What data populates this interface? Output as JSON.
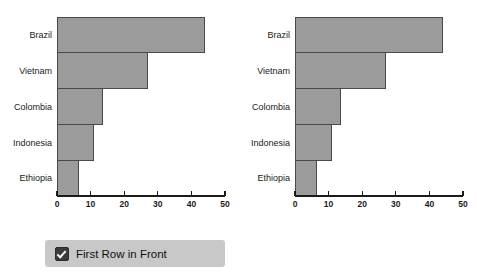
{
  "chart_data": [
    {
      "type": "bar",
      "orientation": "horizontal",
      "title": "",
      "xlabel": "",
      "ylabel": "",
      "categories": [
        "Brazil",
        "Vietnam",
        "Colombia",
        "Indonesia",
        "Ethiopia"
      ],
      "values": [
        44,
        27,
        13.5,
        11,
        6.5
      ],
      "xticks": [
        0,
        10,
        20,
        30,
        40,
        50
      ],
      "xlim": [
        0,
        50
      ],
      "grid": false,
      "legend": "",
      "draw_order": "first-row-in-front",
      "bar_fill": "#9b9b9b",
      "bar_stroke": "#4a4a4a"
    },
    {
      "type": "bar",
      "orientation": "horizontal",
      "title": "",
      "xlabel": "",
      "ylabel": "",
      "categories": [
        "Brazil",
        "Vietnam",
        "Colombia",
        "Indonesia",
        "Ethiopia"
      ],
      "values": [
        44,
        27,
        13.5,
        11,
        6.5
      ],
      "xticks": [
        0,
        10,
        20,
        30,
        40,
        50
      ],
      "xlim": [
        0,
        50
      ],
      "grid": false,
      "legend": "",
      "draw_order": "last-row-in-front",
      "bar_fill": "#9b9b9b",
      "bar_stroke": "#4a4a4a"
    }
  ],
  "legend": {
    "checkbox_checked": true,
    "label": "First Row in Front"
  }
}
